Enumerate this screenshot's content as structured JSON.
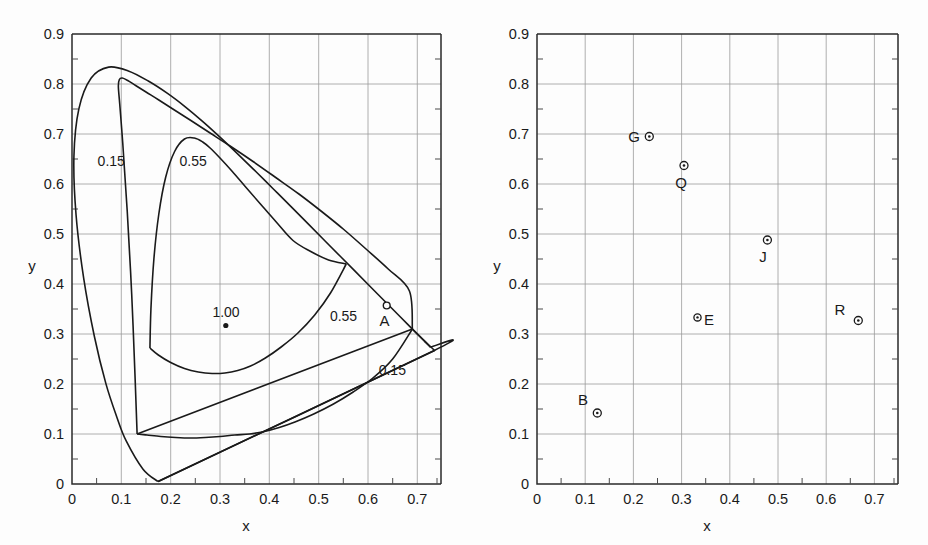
{
  "figure": {
    "panels": [
      {
        "id": "left",
        "axis": {
          "xlabel": "x",
          "ylabel": "y",
          "xticks": [
            "0",
            "0.1",
            "0.2",
            "0.3",
            "0.4",
            "0.5",
            "0.6",
            "0.7"
          ],
          "yticks": [
            "0",
            "0.1",
            "0.2",
            "0.3",
            "0.4",
            "0.5",
            "0.6",
            "0.7",
            "0.8",
            "0.9"
          ],
          "xlim": [
            0,
            0.75
          ],
          "ylim": [
            0,
            0.9
          ]
        },
        "annotations": [
          {
            "name": "contour-label-0-15-upper",
            "text": "0.15",
            "x": 0.052,
            "y": 0.655
          },
          {
            "name": "contour-label-0-55-upper",
            "text": "0.55",
            "x": 0.218,
            "y": 0.655
          },
          {
            "name": "contour-label-0-55-lower",
            "text": "0.55",
            "x": 0.523,
            "y": 0.345
          },
          {
            "name": "contour-label-0-15-lower",
            "text": "0.15",
            "x": 0.622,
            "y": 0.237
          },
          {
            "name": "point-label-1-00",
            "text": "1.00",
            "x": 0.305,
            "y": 0.352
          }
        ],
        "points": [
          {
            "name": "illuminant-point-1-00",
            "label": "",
            "x": 0.312,
            "y": 0.317,
            "marker": "filled"
          },
          {
            "name": "point-A",
            "label": "A",
            "x": 0.638,
            "y": 0.353,
            "marker": "open",
            "label_dx": -0.02,
            "label_dy": -0.043
          }
        ]
      },
      {
        "id": "right",
        "axis": {
          "xlabel": "x",
          "ylabel": "y",
          "xticks": [
            "0",
            "0.1",
            "0.2",
            "0.3",
            "0.4",
            "0.5",
            "0.6",
            "0.7"
          ],
          "yticks": [
            "0",
            "0.1",
            "0.2",
            "0.3",
            "0.4",
            "0.5",
            "0.6",
            "0.7",
            "0.8",
            "0.9"
          ],
          "xlim": [
            0,
            0.75
          ],
          "ylim": [
            0,
            0.9
          ]
        },
        "annotations": [],
        "points": [
          {
            "name": "point-G",
            "label": "G",
            "x": 0.233,
            "y": 0.695,
            "marker": "dotted",
            "label_dx": -0.032,
            "label_dy": 0.004
          },
          {
            "name": "point-Q",
            "label": "Q",
            "x": 0.305,
            "y": 0.637,
            "marker": "dotted",
            "label_dx": -0.008,
            "label_dy": -0.046
          },
          {
            "name": "point-J",
            "label": "J",
            "x": 0.478,
            "y": 0.488,
            "marker": "dotted",
            "label_dx": -0.012,
            "label_dy": -0.046
          },
          {
            "name": "point-R",
            "label": "R",
            "x": 0.667,
            "y": 0.327,
            "marker": "dotted",
            "label_dx": -0.042,
            "label_dy": 0.012
          },
          {
            "name": "point-B",
            "label": "B",
            "x": 0.125,
            "y": 0.142,
            "marker": "dotted",
            "label_dx": -0.032,
            "label_dy": 0.039
          },
          {
            "name": "point-E",
            "label": "E",
            "x": 0.333,
            "y": 0.333,
            "marker": "dotted",
            "label_dx": 0.018,
            "label_dy": -0.012
          }
        ]
      }
    ],
    "colors": {
      "line": "#1a1a1a",
      "grid": "#8c8c8c",
      "background": "#fdfdfd"
    }
  },
  "chart_data": {
    "type": "line",
    "title": "",
    "xlabel": "x",
    "ylabel": "y",
    "xlim": [
      0,
      0.75
    ],
    "ylim": [
      0,
      0.9
    ],
    "grid": true,
    "legend": "none",
    "panels": [
      {
        "name": "left-panel",
        "series": [
          {
            "name": "spectral-locus",
            "comment": "CIE 1931 chromaticity horseshoe boundary",
            "x": [
              0.1741,
              0.144,
              0.1096,
              0.0913,
              0.0687,
              0.0454,
              0.0235,
              0.0082,
              0.0039,
              0.0139,
              0.0389,
              0.0743,
              0.1142,
              0.1547,
              0.1929,
              0.2296,
              0.2658,
              0.3016,
              0.3373,
              0.3731,
              0.4087,
              0.4441,
              0.4788,
              0.5125,
              0.5448,
              0.5752,
              0.6029,
              0.627,
              0.6482,
              0.6658,
              0.6801,
              0.6915,
              0.7006,
              0.7079,
              0.714,
              0.719,
              0.723,
              0.726,
              0.7334,
              0.1741
            ],
            "y": [
              0.005,
              0.0297,
              0.0868,
              0.1327,
              0.2007,
              0.295,
              0.4127,
              0.5384,
              0.6548,
              0.7502,
              0.812,
              0.8338,
              0.8262,
              0.8059,
              0.7816,
              0.7543,
              0.7243,
              0.6923,
              0.6589,
              0.6245,
              0.5896,
              0.5547,
              0.5202,
              0.4866,
              0.4544,
              0.4242,
              0.3965,
              0.3725,
              0.3514,
              0.334,
              0.3197,
              0.3083,
              0.2993,
              0.292,
              0.2859,
              0.2809,
              0.277,
              0.274,
              0.2666,
              0.005
            ]
          },
          {
            "name": "contour-0.15-upper",
            "comment": "inner gamut boundary labelled 0.15, upper lobe",
            "x": [
              0.132,
              0.128,
              0.121,
              0.112,
              0.103,
              0.097,
              0.094,
              0.096,
              0.102,
              0.113,
              0.129,
              0.15,
              0.176,
              0.206,
              0.241,
              0.28,
              0.322,
              0.367,
              0.413,
              0.46,
              0.506,
              0.551,
              0.596,
              0.641,
              0.684,
              0.69
            ],
            "y": [
              0.1,
              0.21,
              0.38,
              0.545,
              0.68,
              0.757,
              0.795,
              0.809,
              0.812,
              0.807,
              0.797,
              0.784,
              0.768,
              0.749,
              0.727,
              0.702,
              0.675,
              0.645,
              0.613,
              0.58,
              0.545,
              0.509,
              0.47,
              0.43,
              0.386,
              0.31
            ]
          },
          {
            "name": "contour-0.15-lower",
            "comment": "inner gamut boundary labelled 0.15, lower branch",
            "x": [
              0.132,
              0.152,
              0.18,
              0.21,
              0.24,
              0.27,
              0.3,
              0.33,
              0.36,
              0.39,
              0.42,
              0.452,
              0.49,
              0.53,
              0.57,
              0.61,
              0.65,
              0.69
            ],
            "y": [
              0.1,
              0.098,
              0.095,
              0.093,
              0.092,
              0.093,
              0.095,
              0.098,
              0.1,
              0.105,
              0.113,
              0.124,
              0.14,
              0.16,
              0.184,
              0.212,
              0.25,
              0.31
            ]
          },
          {
            "name": "contour-0.55-upper",
            "comment": "inner gamut boundary labelled 0.55, upper lobe",
            "x": [
              0.158,
              0.16,
              0.166,
              0.176,
              0.19,
              0.208,
              0.228,
              0.248,
              0.265,
              0.28,
              0.3,
              0.325,
              0.352,
              0.382,
              0.414,
              0.448,
              0.484,
              0.52,
              0.556
            ],
            "y": [
              0.272,
              0.35,
              0.45,
              0.54,
              0.614,
              0.665,
              0.69,
              0.692,
              0.684,
              0.672,
              0.652,
              0.625,
              0.594,
              0.56,
              0.524,
              0.487,
              0.465,
              0.448,
              0.44
            ]
          },
          {
            "name": "contour-0.55-lower",
            "comment": "inner gamut boundary labelled 0.55, lower branch",
            "x": [
              0.158,
              0.175,
              0.2,
              0.228,
              0.256,
              0.284,
              0.31,
              0.336,
              0.362,
              0.392,
              0.424,
              0.458,
              0.492,
              0.524,
              0.556
            ],
            "y": [
              0.272,
              0.258,
              0.243,
              0.231,
              0.224,
              0.221,
              0.222,
              0.227,
              0.236,
              0.252,
              0.274,
              0.302,
              0.338,
              0.382,
              0.44
            ]
          },
          {
            "name": "triangle-0.15-outer",
            "comment": "straight-sided gamut with vertices near (0.175,0.005),(0.735,0.267),(0.690,0.310)",
            "x": [
              0.175,
              0.735,
              0.69,
              0.132
            ],
            "y": [
              0.005,
              0.267,
              0.31,
              0.1
            ]
          }
        ],
        "points": [
          {
            "name": "1.00",
            "x": 0.312,
            "y": 0.317
          },
          {
            "name": "A",
            "x": 0.638,
            "y": 0.353
          }
        ]
      },
      {
        "name": "right-panel",
        "series": [
          {
            "name": "spectral-locus",
            "comment": "CIE 1931 chromaticity horseshoe boundary",
            "x": [
              0.1741,
              0.144,
              0.1096,
              0.0913,
              0.0687,
              0.0454,
              0.0235,
              0.0082,
              0.0039,
              0.0139,
              0.0389,
              0.0743,
              0.1142,
              0.1547,
              0.1929,
              0.2296,
              0.2658,
              0.3016,
              0.3373,
              0.3731,
              0.4087,
              0.4441,
              0.4788,
              0.5125,
              0.5448,
              0.5752,
              0.6029,
              0.627,
              0.6482,
              0.6658,
              0.6801,
              0.6915,
              0.7006,
              0.7079,
              0.714,
              0.719,
              0.723,
              0.726,
              0.7334,
              0.1741
            ],
            "y": [
              0.005,
              0.0297,
              0.0868,
              0.1327,
              0.2007,
              0.295,
              0.4127,
              0.5384,
              0.6548,
              0.7502,
              0.812,
              0.8338,
              0.8262,
              0.8059,
              0.7816,
              0.7543,
              0.7243,
              0.6923,
              0.6589,
              0.6245,
              0.5896,
              0.5547,
              0.5202,
              0.4866,
              0.4544,
              0.4242,
              0.3965,
              0.3725,
              0.3514,
              0.334,
              0.3197,
              0.3083,
              0.2993,
              0.292,
              0.2859,
              0.2809,
              0.277,
              0.274,
              0.2666,
              0.005
            ]
          },
          {
            "name": "gamut-triangle-RGB",
            "comment": "triangle through primaries R, G, B",
            "x": [
              0.233,
              0.667,
              0.125,
              0.233
            ],
            "y": [
              0.695,
              0.327,
              0.142,
              0.695
            ]
          },
          {
            "name": "outer-straight-line",
            "comment": "purple line from locus short-wave end to long-wave end",
            "x": [
              0.175,
              0.735
            ],
            "y": [
              0.005,
              0.267
            ]
          },
          {
            "name": "edge-R-to-locus-end",
            "x": [
              0.667,
              0.735
            ],
            "y": [
              0.327,
              0.267
            ]
          }
        ],
        "points": [
          {
            "name": "G",
            "x": 0.233,
            "y": 0.695
          },
          {
            "name": "Q",
            "x": 0.305,
            "y": 0.637
          },
          {
            "name": "J",
            "x": 0.478,
            "y": 0.488
          },
          {
            "name": "R",
            "x": 0.667,
            "y": 0.327
          },
          {
            "name": "B",
            "x": 0.125,
            "y": 0.142
          },
          {
            "name": "E",
            "x": 0.333,
            "y": 0.333
          }
        ]
      }
    ]
  }
}
